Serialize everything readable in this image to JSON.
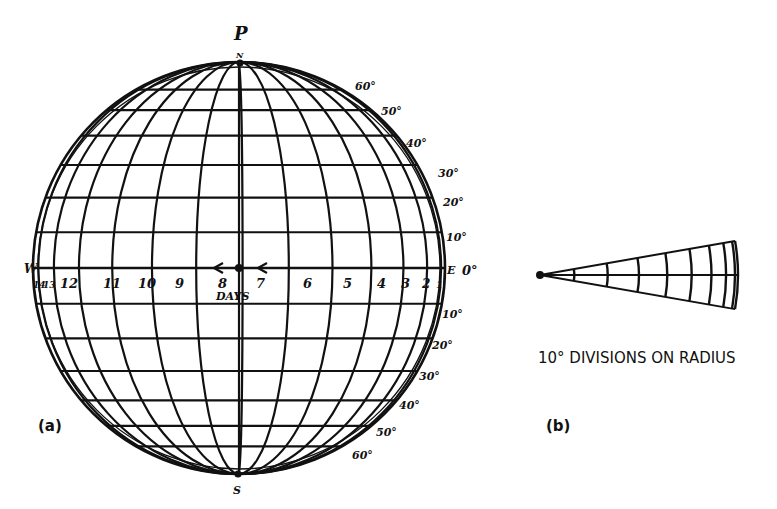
{
  "figure_a": {
    "label": "(a)",
    "pole_label_top": "P",
    "north_label": "N",
    "south_label": "S",
    "west_label": "W",
    "east_label": "E",
    "equator_label": "0°",
    "axis_label": "DAYS",
    "day_numbers": [
      "14",
      "13",
      "12",
      "11",
      "10",
      "9",
      "8",
      "7",
      "6",
      "5",
      "4",
      "3",
      "2",
      "1"
    ],
    "north_latitudes": [
      "10°",
      "20°",
      "30°",
      "40°",
      "50°",
      "60°"
    ],
    "south_latitudes": [
      "10°",
      "20°",
      "30°",
      "40°",
      "50°",
      "60°"
    ]
  },
  "figure_b": {
    "label": "(b)",
    "caption": "10° DIVISIONS ON RADIUS"
  },
  "colors": {
    "ink": "#111111",
    "paper": "#ffffff"
  }
}
